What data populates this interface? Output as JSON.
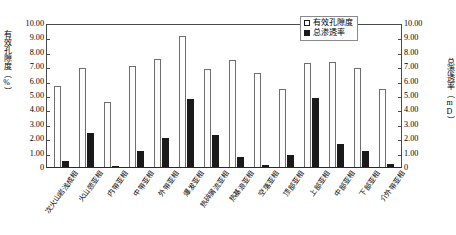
{
  "chart_data": {
    "type": "bar",
    "title": "",
    "xlabel": "",
    "ylabel": "有效孔隙度（%）",
    "y2label": "总渗透率（mD）",
    "ylim": [
      0,
      10
    ],
    "y2lim": [
      0,
      10
    ],
    "grid": false,
    "legend_position": "top-right",
    "categories": [
      "次火山岩浅成相",
      "火山颈亚相",
      "内带亚相",
      "中带亚相",
      "外带亚相",
      "爆发亚相",
      "热碎屑流亚相",
      "热基浪亚相",
      "空落亚相",
      "顶部亚相",
      "上部亚相",
      "中部亚相",
      "下部亚相",
      "介外带亚相"
    ],
    "series": [
      {
        "name": "有效孔隙度",
        "unit": "%",
        "axis": "left",
        "color": "#FFFFFF",
        "values": [
          5.6,
          6.9,
          4.5,
          7.0,
          7.5,
          9.1,
          6.8,
          7.4,
          6.5,
          5.4,
          7.2,
          7.3,
          6.9,
          5.4
        ]
      },
      {
        "name": "总渗透率",
        "unit": "mD",
        "axis": "right",
        "color": "#1A1A1A",
        "values": [
          0.45,
          2.35,
          0.1,
          1.1,
          2.0,
          4.7,
          2.2,
          0.7,
          0.15,
          0.85,
          4.8,
          1.6,
          1.1,
          0.2
        ]
      }
    ],
    "left_ticks": [
      "10.00",
      "9.00",
      "8.00",
      "7.00",
      "6.00",
      "5.00",
      "4.00",
      "3.00",
      "2.00",
      "1.00",
      "0"
    ],
    "right_ticks": [
      "10.00",
      "9.00",
      "8.00",
      "7.00",
      "6.00",
      "5.00",
      "4.00",
      "3.00",
      "2.00",
      "1.00",
      "0"
    ]
  },
  "legend": {
    "porosity_label": "有效孔隙度",
    "permeability_label": "总渗透率"
  },
  "caption": ""
}
